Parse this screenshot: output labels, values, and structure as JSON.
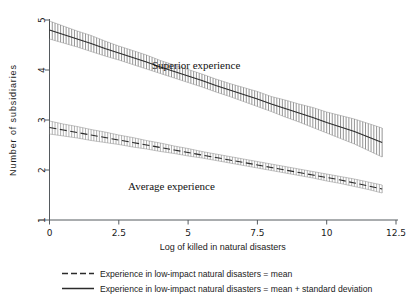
{
  "figure": {
    "background": "#ffffff",
    "ink_color": "#2b2b2b"
  },
  "annotations": {
    "superior": "Superior experience",
    "average": "Average experience"
  },
  "axes": {
    "x_title": "Log of killed in natural disasters",
    "y_title": "Number of subsidiaries",
    "x_ticks": [
      "0",
      "2.5",
      "5",
      "7.5",
      "10",
      "12.5"
    ],
    "y_ticks": [
      "1",
      "2",
      "3",
      "4",
      "5"
    ]
  },
  "legend": {
    "items": [
      {
        "style": "dashed",
        "label": "Experience in low-impact natural disasters = mean"
      },
      {
        "style": "solid",
        "label": "Experience in low-impact natural disasters = mean + standard deviation"
      }
    ]
  },
  "chart_data": {
    "type": "line",
    "title": "",
    "xlabel": "Log of killed in natural disasters",
    "ylabel": "Number of subsidiaries",
    "xlim": [
      0,
      12.5
    ],
    "ylim": [
      1,
      5
    ],
    "xticks": [
      0,
      2.5,
      5,
      7.5,
      10,
      12.5
    ],
    "yticks": [
      1,
      2,
      3,
      4,
      5
    ],
    "grid": false,
    "legend_position": "below-axes",
    "error_display": "vertical-hatched confidence band",
    "x": [
      0,
      0.5,
      1,
      1.5,
      2,
      2.5,
      3,
      3.5,
      4,
      4.5,
      5,
      5.5,
      6,
      6.5,
      7,
      7.5,
      8,
      8.5,
      9,
      9.5,
      10,
      10.5,
      11,
      11.5,
      12
    ],
    "series": [
      {
        "name": "Experience in low-impact natural disasters = mean + standard deviation",
        "label_on_plot": "Superior experience",
        "style": "solid",
        "values": [
          4.8,
          4.71,
          4.62,
          4.53,
          4.43,
          4.34,
          4.25,
          4.16,
          4.06,
          3.97,
          3.88,
          3.79,
          3.69,
          3.6,
          3.51,
          3.42,
          3.32,
          3.23,
          3.14,
          3.05,
          2.95,
          2.86,
          2.77,
          2.66,
          2.55
        ],
        "ci_lower": [
          4.62,
          4.54,
          4.46,
          4.37,
          4.28,
          4.2,
          4.11,
          4.02,
          3.93,
          3.84,
          3.75,
          3.66,
          3.56,
          3.47,
          3.37,
          3.27,
          3.17,
          3.06,
          2.96,
          2.85,
          2.74,
          2.63,
          2.52,
          2.39,
          2.26
        ],
        "ci_upper": [
          4.98,
          4.88,
          4.78,
          4.69,
          4.58,
          4.48,
          4.39,
          4.3,
          4.19,
          4.1,
          4.01,
          3.92,
          3.82,
          3.73,
          3.65,
          3.57,
          3.47,
          3.4,
          3.32,
          3.25,
          3.16,
          3.09,
          3.02,
          2.93,
          2.84
        ]
      },
      {
        "name": "Experience in low-impact natural disasters = mean",
        "label_on_plot": "Average experience",
        "style": "dashed",
        "values": [
          2.85,
          2.8,
          2.75,
          2.7,
          2.65,
          2.6,
          2.55,
          2.5,
          2.45,
          2.4,
          2.35,
          2.3,
          2.25,
          2.2,
          2.15,
          2.1,
          2.05,
          2.0,
          1.95,
          1.9,
          1.85,
          1.8,
          1.74,
          1.68,
          1.62
        ],
        "ci_lower": [
          2.72,
          2.68,
          2.64,
          2.59,
          2.55,
          2.51,
          2.46,
          2.42,
          2.37,
          2.33,
          2.28,
          2.24,
          2.19,
          2.14,
          2.09,
          2.04,
          1.99,
          1.94,
          1.89,
          1.84,
          1.78,
          1.73,
          1.67,
          1.61,
          1.54
        ],
        "ci_upper": [
          2.98,
          2.92,
          2.87,
          2.81,
          2.76,
          2.7,
          2.65,
          2.59,
          2.54,
          2.48,
          2.43,
          2.37,
          2.32,
          2.27,
          2.22,
          2.17,
          2.12,
          2.07,
          2.02,
          1.97,
          1.92,
          1.87,
          1.82,
          1.76,
          1.7
        ]
      }
    ]
  }
}
